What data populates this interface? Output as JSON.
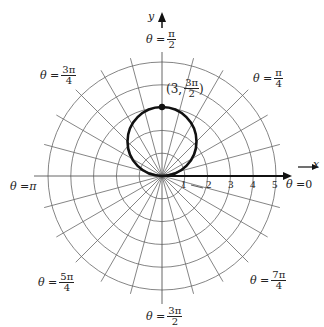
{
  "axes": {
    "x_label": "x",
    "y_label": "y"
  },
  "angle_labels": [
    {
      "id": "t0",
      "prefix": "θ = ",
      "value": "0",
      "num": "",
      "den": ""
    },
    {
      "id": "t1",
      "prefix": "θ = ",
      "value": "",
      "num": "π",
      "den": "4"
    },
    {
      "id": "t2",
      "prefix": "θ = ",
      "value": "",
      "num": "π",
      "den": "2"
    },
    {
      "id": "t3",
      "prefix": "θ = ",
      "value": "",
      "num": "3π",
      "den": "4"
    },
    {
      "id": "t4",
      "prefix": "θ = ",
      "value": "π",
      "num": "",
      "den": ""
    },
    {
      "id": "t5",
      "prefix": "θ = ",
      "value": "",
      "num": "5π",
      "den": "4"
    },
    {
      "id": "t6",
      "prefix": "θ = ",
      "value": "",
      "num": "3π",
      "den": "2"
    },
    {
      "id": "t7",
      "prefix": "θ = ",
      "value": "",
      "num": "7π",
      "den": "4"
    }
  ],
  "radial_ticks": [
    "1",
    "2",
    "3",
    "4",
    "5"
  ],
  "point_label": {
    "prefix": "(3, ",
    "num": "3π",
    "den": "2",
    "suffix": ")"
  },
  "curve": {
    "description": "circle through pole, diameter 3, centered on positive y-axis",
    "equation": "r = -3 sin θ",
    "marked_point": {
      "r": 3,
      "theta": "3π/2"
    }
  },
  "grid": {
    "rings": 5,
    "spoke_step_degrees": 15
  },
  "colors": {
    "grid": "#555555",
    "curve": "#111111",
    "axis": "#111111"
  }
}
